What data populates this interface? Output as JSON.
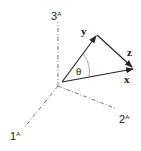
{
  "diagram": {
    "axes": [
      {
        "id": "axis-1",
        "label": "1",
        "superscript": "A",
        "style": "dash-dot"
      },
      {
        "id": "axis-2",
        "label": "2",
        "superscript": "A",
        "style": "dash-dot"
      },
      {
        "id": "axis-3",
        "label": "3",
        "superscript": "A",
        "style": "dash-dot"
      }
    ],
    "vectors": [
      {
        "id": "x",
        "label": "x"
      },
      {
        "id": "y",
        "label": "y"
      },
      {
        "id": "z",
        "label": "z"
      }
    ],
    "angle": {
      "label": "θ",
      "between": [
        "x",
        "y"
      ]
    },
    "colors": {
      "line": "#222222",
      "axis": "#555555",
      "arc": "#888888"
    }
  }
}
